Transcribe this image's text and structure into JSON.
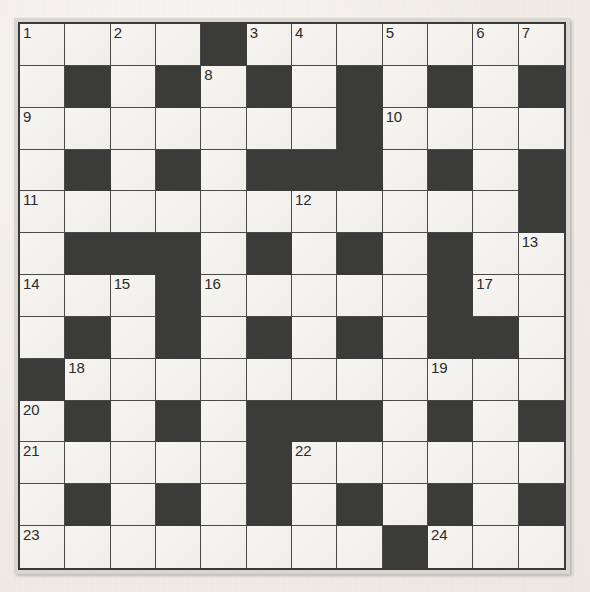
{
  "puzzle": {
    "title": "Crossword Grid",
    "columns": 12,
    "rows": 13,
    "colors": {
      "block": "#3b3b39",
      "light": "#f3f2ee",
      "grid_line": "#4a4a48",
      "frame": "#d9d6cf",
      "paper": "#f2efe9",
      "number_text": "#2b2b2b"
    },
    "legend": {
      "block_label": "blocked square",
      "light_label": "open square"
    },
    "grid": [
      [
        "1",
        "",
        "2",
        "",
        "#",
        "3",
        "4",
        "",
        "5",
        "",
        "6",
        "7"
      ],
      [
        "",
        "#",
        "",
        "#",
        "8",
        "#",
        "",
        "#",
        "",
        "#",
        "",
        "#"
      ],
      [
        "9",
        "",
        "",
        "",
        "",
        "",
        "",
        "#",
        "10",
        "",
        "",
        ""
      ],
      [
        "",
        "#",
        "",
        "#",
        "",
        "#",
        "#",
        "#",
        "",
        "#",
        "",
        "#"
      ],
      [
        "11",
        "",
        "",
        "",
        "",
        "",
        "12",
        "",
        "",
        "",
        "",
        "#"
      ],
      [
        "",
        "#",
        "#",
        "#",
        "",
        "#",
        "",
        "#",
        "",
        "#",
        "",
        "13"
      ],
      [
        "14",
        "",
        "15",
        "#",
        "16",
        "",
        "",
        "",
        "",
        "#",
        "17",
        ""
      ],
      [
        "",
        "#",
        "",
        "#",
        "",
        "#",
        "",
        "#",
        "",
        "#",
        "#",
        ""
      ],
      [
        "#",
        "18",
        "",
        "",
        "",
        "",
        "",
        "",
        "",
        "19",
        "",
        ""
      ],
      [
        "20",
        "#",
        "",
        "#",
        "",
        "#",
        "#",
        "#",
        "",
        "#",
        "",
        "#"
      ],
      [
        "21",
        "",
        "",
        "",
        "",
        "#",
        "22",
        "",
        "",
        "",
        "",
        ""
      ],
      [
        "",
        "#",
        "",
        "#",
        "",
        "#",
        "",
        "#",
        "",
        "#",
        "",
        "#"
      ],
      [
        "23",
        "",
        "",
        "",
        "",
        "",
        "",
        "",
        "#",
        "24",
        "",
        ""
      ]
    ],
    "numbers": [
      {
        "n": "1",
        "row": 1,
        "col": 1
      },
      {
        "n": "2",
        "row": 1,
        "col": 3
      },
      {
        "n": "3",
        "row": 1,
        "col": 6
      },
      {
        "n": "4",
        "row": 1,
        "col": 7
      },
      {
        "n": "5",
        "row": 1,
        "col": 9
      },
      {
        "n": "6",
        "row": 1,
        "col": 11
      },
      {
        "n": "7",
        "row": 1,
        "col": 12
      },
      {
        "n": "8",
        "row": 2,
        "col": 5
      },
      {
        "n": "9",
        "row": 3,
        "col": 1
      },
      {
        "n": "10",
        "row": 3,
        "col": 9
      },
      {
        "n": "11",
        "row": 5,
        "col": 1
      },
      {
        "n": "12",
        "row": 5,
        "col": 7
      },
      {
        "n": "13",
        "row": 6,
        "col": 12
      },
      {
        "n": "14",
        "row": 7,
        "col": 1
      },
      {
        "n": "15",
        "row": 7,
        "col": 3
      },
      {
        "n": "16",
        "row": 7,
        "col": 5
      },
      {
        "n": "17",
        "row": 7,
        "col": 11
      },
      {
        "n": "18",
        "row": 9,
        "col": 2
      },
      {
        "n": "19",
        "row": 9,
        "col": 10
      },
      {
        "n": "20",
        "row": 10,
        "col": 1
      },
      {
        "n": "21",
        "row": 11,
        "col": 1
      },
      {
        "n": "22",
        "row": 11,
        "col": 7
      },
      {
        "n": "23",
        "row": 13,
        "col": 1
      },
      {
        "n": "24",
        "row": 13,
        "col": 10
      }
    ],
    "max_clue_number": "24"
  }
}
